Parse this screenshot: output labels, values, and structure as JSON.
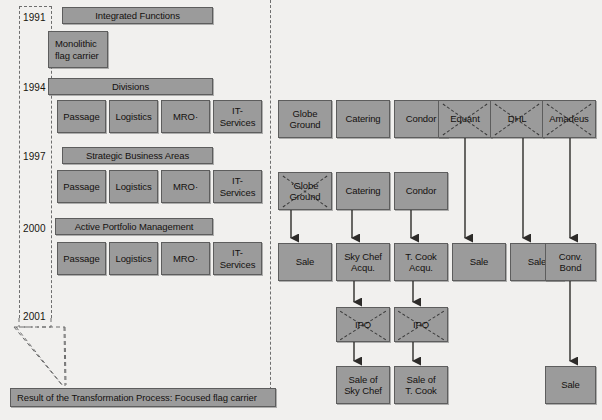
{
  "diagram": {
    "background_color": "#f1f0ee",
    "box_fill": "#9b9b9b",
    "box_border": "#5d5d5d"
  },
  "timeline": {
    "years": [
      {
        "label": "1991",
        "y": 12
      },
      {
        "label": "1994",
        "y": 82
      },
      {
        "label": "1997",
        "y": 151
      },
      {
        "label": "2000",
        "y": 223
      },
      {
        "label": "2001",
        "y": 311
      }
    ]
  },
  "left_column": {
    "stages": [
      {
        "header": "Integrated Functions",
        "units": [
          "Monolithic\nflag carrier"
        ]
      },
      {
        "header": "Divisions",
        "units": [
          "Passage",
          "Logistics",
          "MRO·",
          "IT-\nServices"
        ]
      },
      {
        "header": "Strategic Business Areas",
        "units": [
          "Passage",
          "Logistics",
          "MRO·",
          "IT-\nServices"
        ]
      },
      {
        "header": "Active Portfolio Management",
        "units": [
          "Passage",
          "Logistics",
          "MRO·",
          "IT-\nServices"
        ]
      }
    ],
    "result": "Result of the Transformation Process: Focused flag carrier"
  },
  "right_column": {
    "row1": [
      {
        "label": "Globe\nGround",
        "crossed": false
      },
      {
        "label": "Catering",
        "crossed": false
      },
      {
        "label": "Condor",
        "crossed": false
      },
      {
        "label": "Equant",
        "crossed": true
      },
      {
        "label": "DHL",
        "crossed": true
      },
      {
        "label": "Amadeus",
        "crossed": true
      }
    ],
    "row2": [
      {
        "label": "‘Globe\nGround",
        "crossed": true
      },
      {
        "label": "Catering",
        "crossed": false
      },
      {
        "label": "Condor",
        "crossed": false
      }
    ],
    "row3": [
      {
        "label": "Sale",
        "crossed": false
      },
      {
        "label": "Sky Chef\nAcqu.",
        "crossed": false
      },
      {
        "label": "T. Cook\nAcqu.",
        "crossed": false
      },
      {
        "label": "Sale",
        "crossed": false
      },
      {
        "label": "Sale",
        "crossed": false
      },
      {
        "label": "Conv.\nBond",
        "crossed": false
      }
    ],
    "row4": [
      {
        "label": "IPO",
        "crossed": true
      },
      {
        "label": "IPO",
        "crossed": true
      }
    ],
    "row5": [
      {
        "label": "Sale of\nSky Chef",
        "crossed": false
      },
      {
        "label": "Sale of\nT. Cook",
        "crossed": false
      },
      {
        "label": "Sale",
        "crossed": false
      }
    ]
  }
}
